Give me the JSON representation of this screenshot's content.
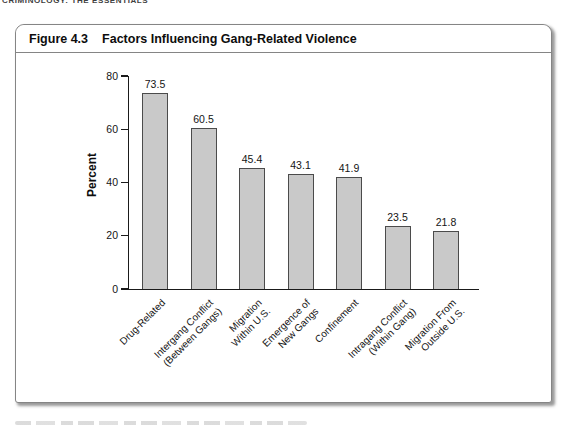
{
  "page": {
    "running_head": "CRIMINOLOGY: THE ESSENTIALS"
  },
  "figure": {
    "label": "Figure 4.3",
    "title": "Factors Influencing Gang-Related Violence"
  },
  "chart_data": {
    "type": "bar",
    "title": "Factors Influencing Gang-Related Violence",
    "ylabel": "Percent",
    "xlabel": "",
    "ylim": [
      0,
      80
    ],
    "yticks": [
      0,
      20,
      40,
      60,
      80
    ],
    "grid": false,
    "legend": false,
    "categories": [
      [
        "Drug-Related"
      ],
      [
        "Intergang Conflict",
        "(Between Gangs)"
      ],
      [
        "Migration",
        "Within U.S."
      ],
      [
        "Emergence of",
        "New Gangs"
      ],
      [
        "Confinement"
      ],
      [
        "Intragang Conflict",
        "(Within Gang)"
      ],
      [
        "Migration From",
        "Outside U.S."
      ]
    ],
    "values": [
      73.5,
      60.5,
      45.4,
      43.1,
      41.9,
      23.5,
      21.8
    ],
    "value_labels": [
      "73.5",
      "60.5",
      "45.4",
      "43.1",
      "41.9",
      "23.5",
      "21.8"
    ],
    "colors": {
      "bar_fill": "#c9c9c9",
      "bar_border": "#4b4b4b",
      "axis": "#1a1a1a",
      "frame_border": "#858585"
    }
  }
}
